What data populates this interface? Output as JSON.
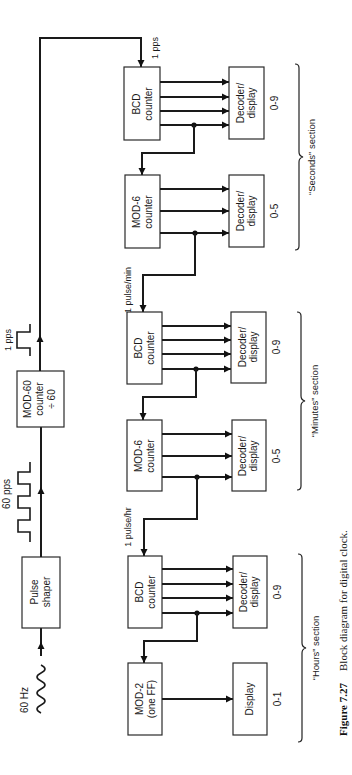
{
  "figure": {
    "number": "Figure 7.27",
    "caption": "Block diagram for digital clock."
  },
  "signals": {
    "input": "60 Hz",
    "shaped": "60 pps",
    "one_pps_top": "1 pps",
    "one_pps_seconds": "1 pps",
    "pulse_min": "1 pulse/min",
    "pulse_hr": "1 pulse/hr"
  },
  "blocks": {
    "pulse_shaper": {
      "line1": "Pulse",
      "line2": "shaper"
    },
    "mod60": {
      "line1": "MOD-60",
      "line2": "counter",
      "line3": "÷ 60"
    },
    "sec_bcd": {
      "line1": "BCD",
      "line2": "counter"
    },
    "sec_mod6": {
      "line1": "MOD-6",
      "line2": "counter"
    },
    "min_bcd": {
      "line1": "BCD",
      "line2": "counter"
    },
    "min_mod6": {
      "line1": "MOD-6",
      "line2": "counter"
    },
    "hr_bcd": {
      "line1": "BCD",
      "line2": "counter"
    },
    "hr_mod2": {
      "line1": "MOD-2",
      "line2": "(one FF)"
    },
    "sec_dec09": {
      "line1": "Decoder/",
      "line2": "display",
      "range": "0-9"
    },
    "sec_dec05": {
      "line1": "Decoder/",
      "line2": "display",
      "range": "0-5"
    },
    "min_dec09": {
      "line1": "Decoder/",
      "line2": "display",
      "range": "0-9"
    },
    "min_dec05": {
      "line1": "Decoder/",
      "line2": "display",
      "range": "0-5"
    },
    "hr_dec09": {
      "line1": "Decoder/",
      "line2": "display",
      "range": "0-9"
    },
    "hr_disp01": {
      "line1": "Display",
      "range": "0-1"
    }
  },
  "sections": {
    "seconds": "“Seconds” section",
    "minutes": "“Minutes” section",
    "hours": "“Hours” section"
  }
}
